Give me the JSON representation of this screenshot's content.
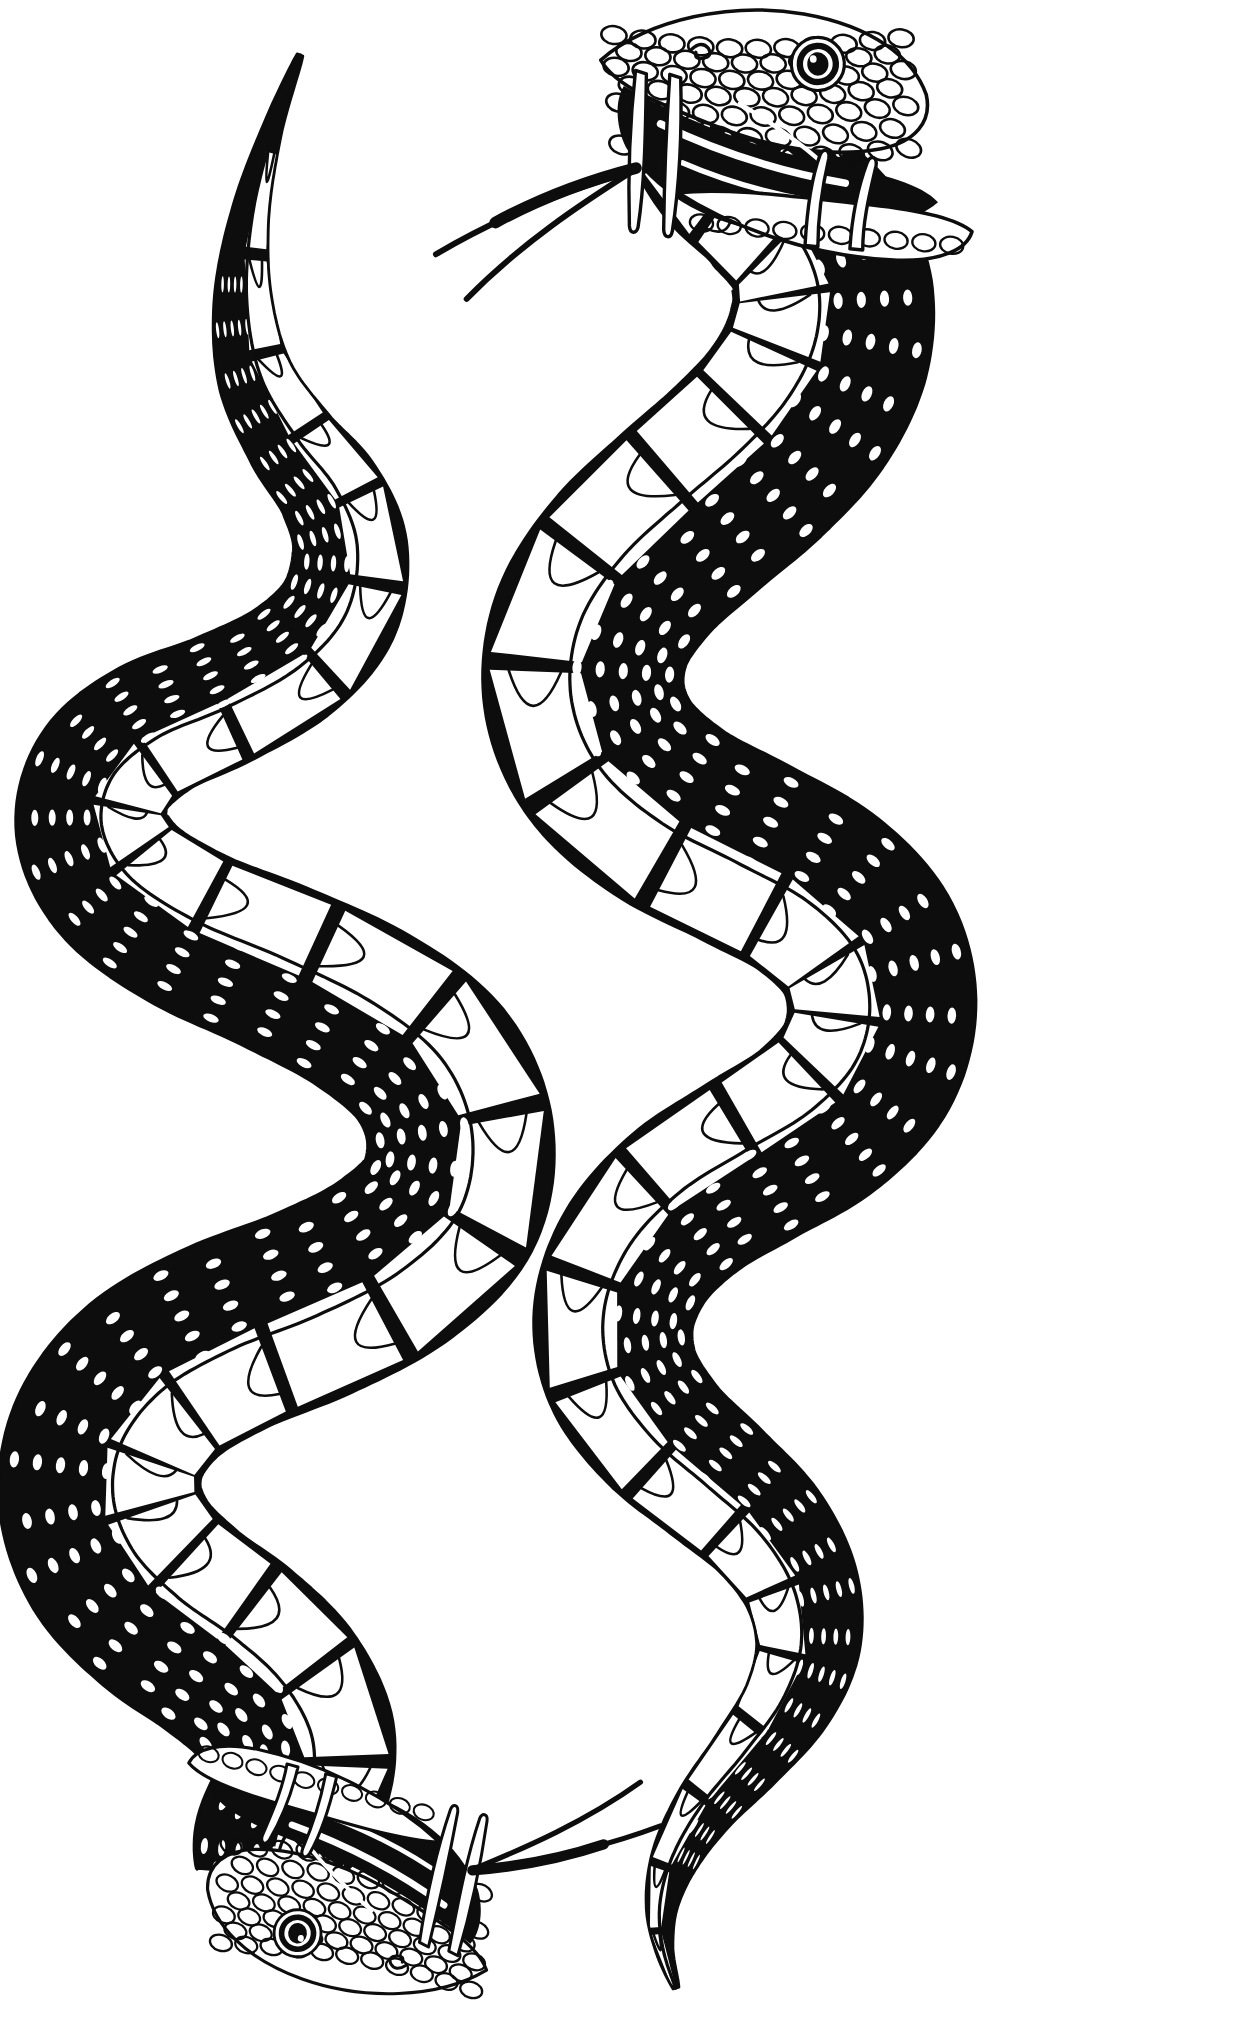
{
  "artwork": {
    "title": "Two Serpents",
    "style": "black-ink tattoo flash line art",
    "medium": "pen and ink",
    "background_color": "#ffffff",
    "ink_color": "#0d0d0d",
    "canvas": {
      "width": 1252,
      "height": 2032
    },
    "subject_count": 2,
    "composition": "two mirrored serpents in vertical S-curves, heads at opposite diagonal corners"
  },
  "subjects": [
    {
      "id": "snake-left",
      "label": "Left Serpent",
      "orientation": "head-down",
      "head_position": "bottom-left",
      "tail_position": "top-left",
      "mouth_state": "open",
      "fang_count": 4,
      "tongue": "forked, extends up and right",
      "eye": {
        "pupil_shape": "round",
        "pupil_color": "#0d0d0d"
      },
      "body_color": "#ffffff",
      "outline_color": "#0d0d0d",
      "scale_pattern": "overlapping oval dorsal scales with banded ventral scutes",
      "spine": [
        [
          300,
          55
        ],
        [
          272,
          130
        ],
        [
          250,
          215
        ],
        [
          243,
          300
        ],
        [
          256,
          378
        ],
        [
          292,
          442
        ],
        [
          330,
          492
        ],
        [
          350,
          548
        ],
        [
          338,
          612
        ],
        [
          292,
          662
        ],
        [
          222,
          700
        ],
        [
          152,
          730
        ],
        [
          104,
          772
        ],
        [
          92,
          828
        ],
        [
          122,
          884
        ],
        [
          190,
          930
        ],
        [
          278,
          968
        ],
        [
          366,
          1012
        ],
        [
          432,
          1066
        ],
        [
          460,
          1134
        ],
        [
          448,
          1206
        ],
        [
          392,
          1262
        ],
        [
          312,
          1304
        ],
        [
          226,
          1338
        ],
        [
          154,
          1380
        ],
        [
          110,
          1436
        ],
        [
          100,
          1498
        ],
        [
          122,
          1558
        ],
        [
          170,
          1608
        ],
        [
          226,
          1648
        ],
        [
          272,
          1690
        ],
        [
          300,
          1740
        ],
        [
          298,
          1792
        ],
        [
          272,
          1840
        ],
        [
          268,
          1874
        ]
      ],
      "widths": [
        3,
        10,
        19,
        29,
        38,
        46,
        52,
        57,
        61,
        64,
        67,
        70,
        73,
        76,
        79,
        82,
        85,
        88,
        91,
        93,
        95,
        96,
        97,
        98,
        99,
        100,
        101,
        102,
        102,
        101,
        99,
        95,
        88,
        78,
        70
      ]
    },
    {
      "id": "snake-right",
      "label": "Right Serpent",
      "orientation": "head-up",
      "head_position": "top-right",
      "tail_position": "bottom-center",
      "mouth_state": "open",
      "fang_count": 4,
      "tongue": "forked, extends down and left",
      "eye": {
        "pupil_shape": "round",
        "pupil_color": "#0d0d0d"
      },
      "body_color": "#ffffff",
      "outline_color": "#0d0d0d",
      "scale_pattern": "overlapping oval dorsal scales with banded ventral scutes",
      "spine": [
        [
          695,
          130
        ],
        [
          728,
          168
        ],
        [
          770,
          198
        ],
        [
          812,
          238
        ],
        [
          832,
          292
        ],
        [
          826,
          352
        ],
        [
          796,
          410
        ],
        [
          748,
          462
        ],
        [
          690,
          512
        ],
        [
          632,
          566
        ],
        [
          592,
          628
        ],
        [
          584,
          696
        ],
        [
          610,
          760
        ],
        [
          668,
          812
        ],
        [
          744,
          852
        ],
        [
          816,
          892
        ],
        [
          866,
          944
        ],
        [
          882,
          1006
        ],
        [
          866,
          1068
        ],
        [
          818,
          1120
        ],
        [
          752,
          1160
        ],
        [
          688,
          1200
        ],
        [
          638,
          1252
        ],
        [
          614,
          1314
        ],
        [
          622,
          1376
        ],
        [
          660,
          1432
        ],
        [
          714,
          1480
        ],
        [
          766,
          1528
        ],
        [
          800,
          1584
        ],
        [
          808,
          1644
        ],
        [
          788,
          1702
        ],
        [
          748,
          1756
        ],
        [
          706,
          1806
        ],
        [
          676,
          1856
        ],
        [
          662,
          1904
        ],
        [
          664,
          1948
        ],
        [
          676,
          1988
        ]
      ],
      "widths": [
        72,
        80,
        88,
        95,
        100,
        103,
        104,
        104,
        103,
        102,
        101,
        100,
        99,
        98,
        97,
        96,
        95,
        94,
        92,
        90,
        88,
        86,
        83,
        80,
        77,
        73,
        69,
        64,
        58,
        52,
        45,
        38,
        31,
        24,
        16,
        9,
        3
      ]
    }
  ],
  "head_upper": {
    "id": "head-right-snake",
    "eye_label": "snake-eye",
    "fangs": [
      "upper-fang-outer",
      "upper-fang-inner",
      "lower-fang-outer",
      "lower-fang-inner"
    ],
    "tongue_label": "forked-tongue",
    "mouth_interior": "#0d0d0d",
    "position": {
      "x": 760,
      "y": 55
    }
  },
  "head_lower": {
    "id": "head-left-snake",
    "eye_label": "snake-eye",
    "fangs": [
      "upper-fang-outer",
      "upper-fang-inner",
      "lower-fang-outer",
      "lower-fang-inner"
    ],
    "tongue_label": "forked-tongue",
    "mouth_interior": "#0d0d0d",
    "position": {
      "x": 300,
      "y": 1860
    }
  },
  "render": {
    "scale_rows": 9,
    "scale_step": 15,
    "scute_step": 17,
    "stroke_weight": 2.6
  }
}
